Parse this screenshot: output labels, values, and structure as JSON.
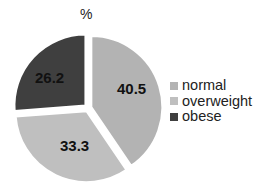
{
  "chart_data": {
    "type": "pie",
    "title": "%",
    "categories": [
      "normal",
      "overweight",
      "obese"
    ],
    "values": [
      40.5,
      33.3,
      26.2
    ],
    "colors": [
      "#b3b3b3",
      "#bfbfbf",
      "#3f3f3f"
    ],
    "start_angle_deg": 0,
    "direction": "clockwise",
    "exploded": true,
    "legend_position": "right",
    "data_labels": [
      "40.5",
      "33.3",
      "26.2"
    ],
    "label_color": "#111111"
  },
  "legend": {
    "items": [
      {
        "label": "normal",
        "color": "#b3b3b3"
      },
      {
        "label": "overweight",
        "color": "#bfbfbf"
      },
      {
        "label": "obese",
        "color": "#3f3f3f"
      }
    ]
  }
}
